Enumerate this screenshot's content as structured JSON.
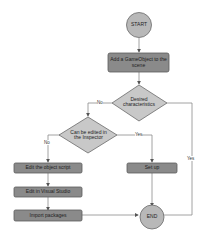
{
  "diagram": {
    "type": "flowchart",
    "colors": {
      "terminal_fill": "#b8b8b8",
      "process_fill": "#8a8a8a",
      "decision_fill": "#c8c8c8",
      "stroke": "#6a6a6a",
      "line": "#8c8c8c"
    },
    "nodes": {
      "start": {
        "label": "START",
        "shape": "circle"
      },
      "add_gameobject": {
        "label": "Add a GameObject to the scene",
        "shape": "process"
      },
      "desired_characteristics": {
        "label": "Desired characteristics",
        "shape": "decision"
      },
      "can_be_edited": {
        "label": "Can be edited in the Inspector",
        "shape": "decision"
      },
      "edit_object_script": {
        "label": "Edit the object script",
        "shape": "process"
      },
      "edit_visual_studio": {
        "label": "Edit in Visual Studio",
        "shape": "process"
      },
      "import_packages": {
        "label": "Import packages",
        "shape": "process"
      },
      "set_up": {
        "label": "Set up",
        "shape": "process"
      },
      "end": {
        "label": "END",
        "shape": "circle"
      }
    },
    "edges": {
      "desired_no": "No",
      "desired_yes": "Yes",
      "editable_no": "No",
      "editable_yes": "Yes"
    }
  }
}
